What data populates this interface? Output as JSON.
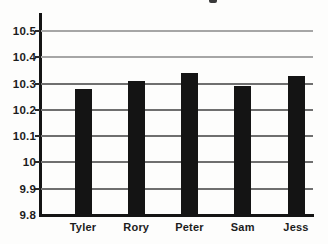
{
  "chart_data": {
    "type": "bar",
    "title": "",
    "categories": [
      "Tyler",
      "Rory",
      "Peter",
      "Sam",
      "Jess"
    ],
    "values": [
      10.28,
      10.31,
      10.34,
      10.29,
      10.33
    ],
    "xlabel": "",
    "ylabel": "",
    "ylim": [
      9.8,
      10.5
    ],
    "ytick_interval": 0.1,
    "yticks": [
      {
        "label": "10.5",
        "value": 10.5
      },
      {
        "label": "10.4",
        "value": 10.4
      },
      {
        "label": "10.3",
        "value": 10.3
      },
      {
        "label": "10.2",
        "value": 10.2
      },
      {
        "label": "10.1",
        "value": 10.1
      },
      {
        "label": "10",
        "value": 10.0
      },
      {
        "label": "9.9",
        "value": 9.9
      },
      {
        "label": "9.8",
        "value": 9.8
      }
    ],
    "grid": true,
    "legend": false,
    "colors": {
      "bar": "#141414",
      "axis": "#141414",
      "gridline_dark": "#6f6f6f",
      "gridline_light": "#a6a6a6",
      "label": "#1c1c1c",
      "background": "#fdfdfc"
    }
  }
}
